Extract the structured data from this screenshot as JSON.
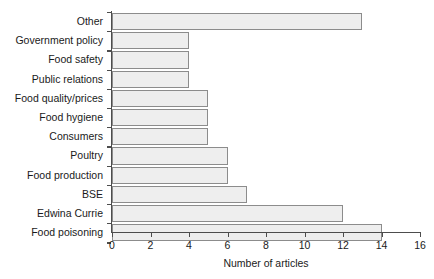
{
  "chart_data": {
    "type": "bar",
    "orientation": "horizontal",
    "title": "",
    "xlabel": "Number of articles",
    "ylabel": "",
    "categories": [
      "Other",
      "Government policy",
      "Food safety",
      "Public relations",
      "Food quality/prices",
      "Food hygiene",
      "Consumers",
      "Poultry",
      "Food production",
      "BSE",
      "Edwina Currie",
      "Food poisoning"
    ],
    "values": [
      13,
      4,
      4,
      4,
      5,
      5,
      5,
      6,
      6,
      7,
      12,
      14
    ],
    "xlim": [
      0,
      16
    ],
    "xticks": [
      0,
      2,
      4,
      6,
      8,
      10,
      12,
      14,
      16
    ],
    "xtick_labels": [
      "0",
      "2",
      "4",
      "6",
      "8",
      "10",
      "12",
      "14",
      "16"
    ],
    "grid": false,
    "legend": false,
    "bar_fill_color": "#eeeeee",
    "bar_border_color": "#8c8c8c",
    "axis_color": "#4d4d4d",
    "text_color": "#1a1a1a"
  }
}
